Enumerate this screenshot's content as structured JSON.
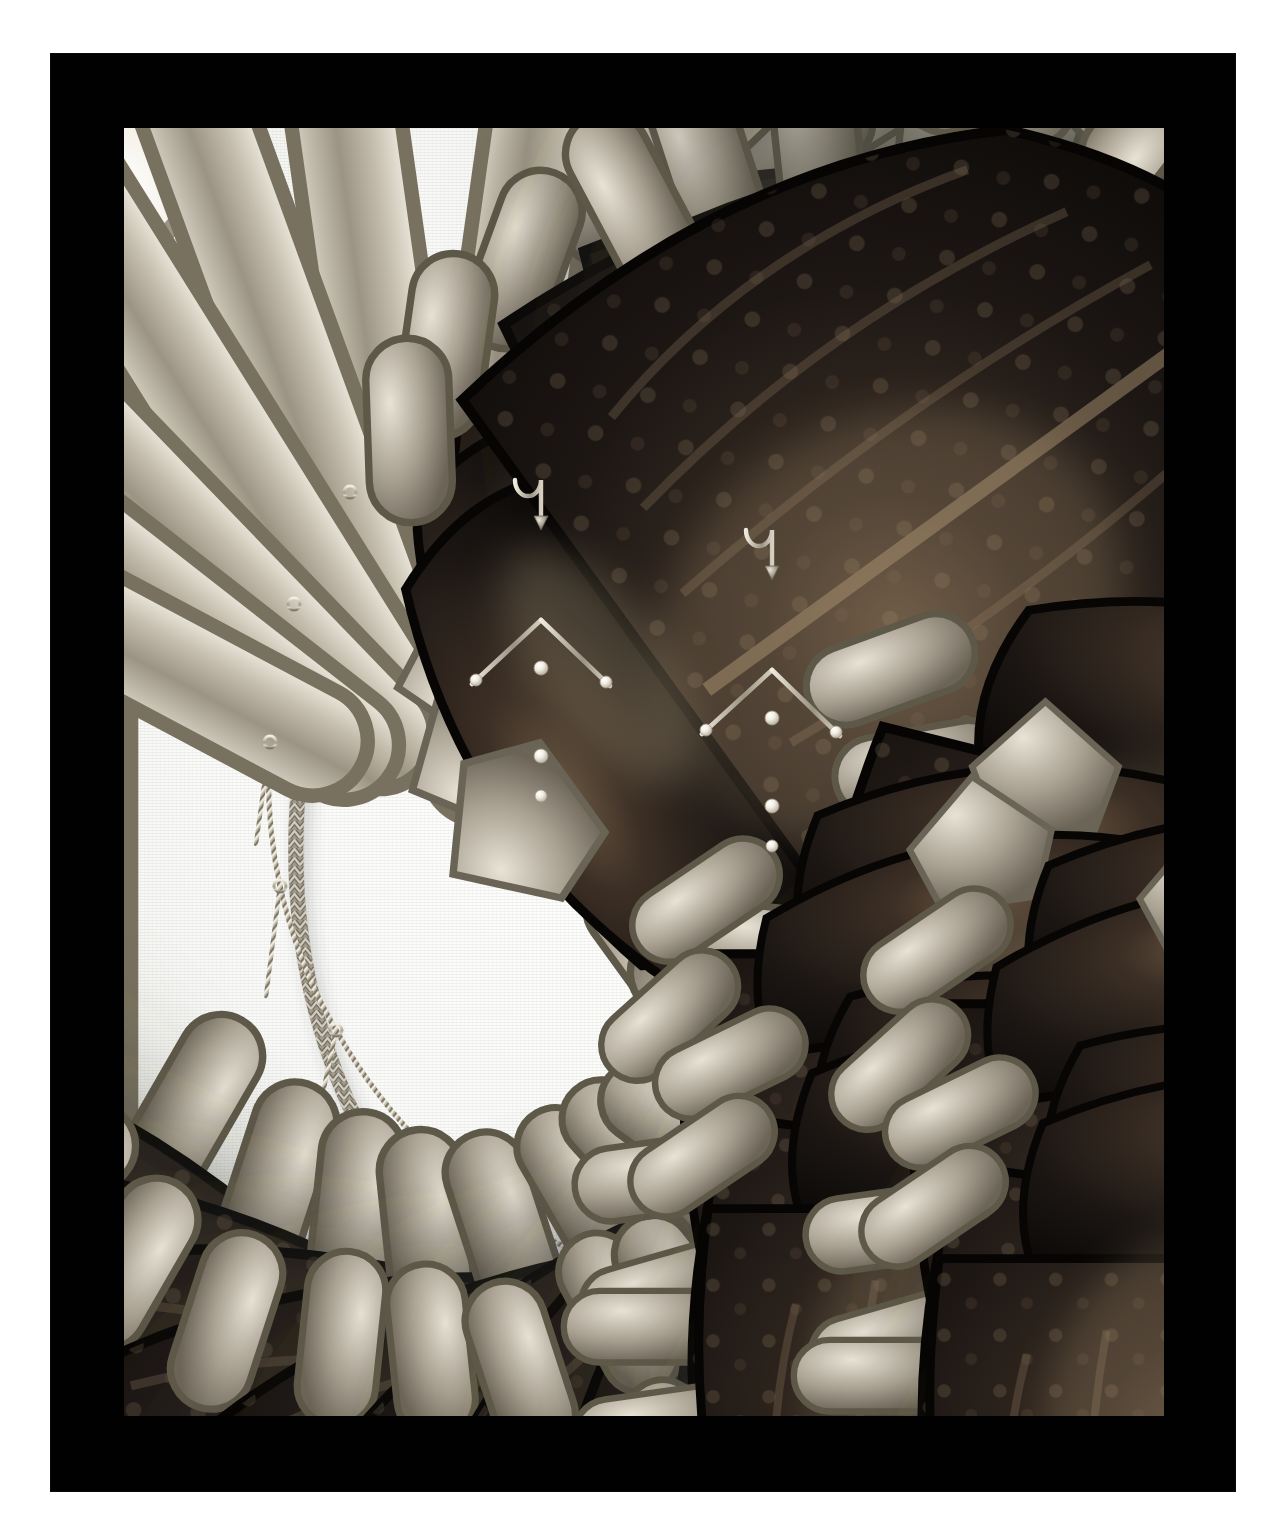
{
  "artwork": {
    "title": "Scarab beetle necklace and pendant earrings",
    "medium": "Gold woven chain set with iridescent beetle elytra and seed pearls",
    "presentation": "Black photographic mount with white linen backdrop"
  },
  "frame": {
    "mount_color": "#010101",
    "backdrop_color": "#fbfbfa",
    "mount_left": 51,
    "mount_top": 54,
    "mount_width": 1184,
    "mount_height": 1437,
    "window_left": 124,
    "window_top": 128,
    "window_width": 1040,
    "window_height": 1288
  },
  "palette": {
    "beetle_body": "#161210",
    "beetle_body_light": "#3a2e25",
    "beetle_highlight": "#6d5a45",
    "gold_chain": "#b9b2a4",
    "gold_chain_light": "#e6e2d8",
    "gold_chain_dark": "#6f6a5e",
    "pearl": "#f5f2e9",
    "pearl_shadow": "#c6c0b2",
    "shadow": "rgba(60,58,54,0.22)"
  },
  "necklace": {
    "name": "scarab-beetle-necklace",
    "shape": "inverted teardrop / pear outline",
    "clasp_label": "bar clasp at top centre",
    "chain_style": "flat woven herringbone chain",
    "beetle_count": 22,
    "pearl_pin_count": 21,
    "centre_drop": "pearl-tipped bar drop at lowest point",
    "beetles": [
      {
        "id": 1,
        "cx": 368,
        "cy": 144,
        "r": 52,
        "rot": -14,
        "side": "left"
      },
      {
        "id": 2,
        "cx": 276,
        "cy": 248,
        "r": 52,
        "rot": -24,
        "side": "left"
      },
      {
        "id": 3,
        "cx": 213,
        "cy": 334,
        "r": 51,
        "rot": -32,
        "side": "left"
      },
      {
        "id": 4,
        "cx": 156,
        "cy": 437,
        "r": 53,
        "rot": -44,
        "side": "left"
      },
      {
        "id": 5,
        "cx": 122,
        "cy": 578,
        "r": 53,
        "rot": -56,
        "side": "left"
      },
      {
        "id": 6,
        "cx": 100,
        "cy": 715,
        "r": 52,
        "rot": -66,
        "side": "left"
      },
      {
        "id": 7,
        "cx": 112,
        "cy": 870,
        "r": 54,
        "rot": -78,
        "side": "left"
      },
      {
        "id": 8,
        "cx": 160,
        "cy": 1022,
        "r": 55,
        "rot": -92,
        "side": "left"
      },
      {
        "id": 9,
        "cx": 262,
        "cy": 1152,
        "r": 55,
        "rot": -104,
        "side": "left"
      },
      {
        "id": 10,
        "cx": 400,
        "cy": 1244,
        "r": 55,
        "rot": -116,
        "side": "left"
      },
      {
        "id": 11,
        "cx": 540,
        "cy": 1300,
        "r": 55,
        "rot": -126,
        "side": "bottom"
      },
      {
        "id": 12,
        "cx": 700,
        "cy": 1298,
        "r": 55,
        "rot": 128,
        "side": "bottom"
      },
      {
        "id": 13,
        "cx": 838,
        "cy": 1232,
        "r": 55,
        "rot": 116,
        "side": "right"
      },
      {
        "id": 14,
        "cx": 940,
        "cy": 1118,
        "r": 55,
        "rot": 104,
        "side": "right"
      },
      {
        "id": 15,
        "cx": 1002,
        "cy": 988,
        "r": 55,
        "rot": 92,
        "side": "right"
      },
      {
        "id": 16,
        "cx": 1028,
        "cy": 848,
        "r": 54,
        "rot": 80,
        "side": "right"
      },
      {
        "id": 17,
        "cx": 1020,
        "cy": 700,
        "r": 52,
        "rot": 68,
        "side": "right"
      },
      {
        "id": 18,
        "cx": 986,
        "cy": 557,
        "r": 52,
        "rot": 56,
        "side": "right"
      },
      {
        "id": 19,
        "cx": 932,
        "cy": 432,
        "r": 52,
        "rot": 44,
        "side": "right"
      },
      {
        "id": 20,
        "cx": 868,
        "cy": 330,
        "r": 51,
        "rot": 34,
        "side": "right"
      },
      {
        "id": 21,
        "cx": 782,
        "cy": 240,
        "r": 52,
        "rot": 24,
        "side": "right"
      },
      {
        "id": 22,
        "cx": 682,
        "cy": 150,
        "r": 52,
        "rot": 14,
        "side": "right"
      }
    ]
  },
  "earrings": [
    {
      "name": "left-pendant-earring",
      "hook_x": 417,
      "hook_y": 336,
      "top_beetle": {
        "cx": 417,
        "cy": 437,
        "r": 48,
        "rot": 0
      },
      "left_beetle": {
        "cx": 340,
        "cy": 585,
        "r": 47,
        "rot": -8
      },
      "right_beetle": {
        "cx": 492,
        "cy": 588,
        "r": 47,
        "rot": 8
      },
      "bottom_beetle": {
        "cx": 417,
        "cy": 700,
        "r": 47,
        "rot": 0
      },
      "pearl_count": 5,
      "beetle_count": 4
    },
    {
      "name": "right-pendant-earring",
      "hook_x": 648,
      "hook_y": 385,
      "top_beetle": {
        "cx": 648,
        "cy": 487,
        "r": 48,
        "rot": 0
      },
      "left_beetle": {
        "cx": 570,
        "cy": 634,
        "r": 47,
        "rot": -8
      },
      "right_beetle": {
        "cx": 722,
        "cy": 637,
        "r": 47,
        "rot": 8
      },
      "bottom_beetle": {
        "cx": 648,
        "cy": 750,
        "r": 47,
        "rot": 0
      },
      "pearl_count": 5,
      "beetle_count": 4
    }
  ],
  "totals": {
    "beetles_total": 30,
    "necklace_beetles": 22,
    "earring_beetles": 8
  }
}
